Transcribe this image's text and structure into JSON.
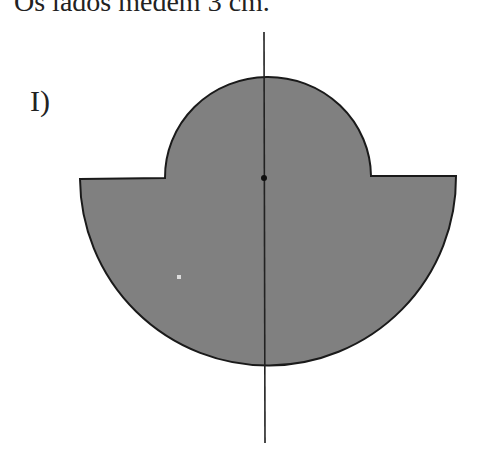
{
  "caption": "Os lados medem 3 cm.",
  "figure_label": "I)",
  "figure": {
    "fill_color": "#808080",
    "stroke_color": "#1a1a1a",
    "center": [
      264,
      178
    ],
    "big_semicircle_radius": 188,
    "small_semicircle_radius": 103,
    "axis": {
      "x": 264,
      "y_start": 32,
      "y_end": 443
    },
    "speck": [
      179,
      277
    ]
  }
}
